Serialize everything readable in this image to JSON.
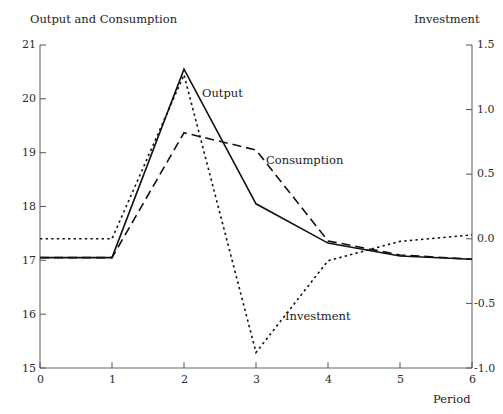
{
  "labels": {
    "left_axis_title": "Output and Consumption",
    "right_axis_title": "Investment",
    "xlabel": "Period",
    "series_output": "Output",
    "series_consumption": "Consumption",
    "series_investment": "Investment"
  },
  "axes": {
    "x_ticks": [
      "0",
      "1",
      "2",
      "3",
      "4",
      "5",
      "6"
    ],
    "left_ticks": [
      "21",
      "20",
      "19",
      "18",
      "17",
      "16",
      "15"
    ],
    "right_ticks": [
      "1.5",
      "1.0",
      "0.5",
      "0.0",
      "-0.5",
      "-1.0"
    ]
  },
  "chart_data": {
    "type": "line",
    "title": "",
    "xlabel": "Period",
    "ylabel": "Output and Consumption",
    "y2label": "Investment",
    "xlim": [
      0,
      6
    ],
    "ylim": [
      15,
      21
    ],
    "y2lim": [
      -1.0,
      1.5
    ],
    "grid": false,
    "legend": "inline-annotations",
    "x": [
      0,
      1,
      2,
      3,
      4,
      5,
      6
    ],
    "series": [
      {
        "name": "Output",
        "axis": "left",
        "style": "solid",
        "values": [
          17.05,
          17.05,
          20.55,
          18.05,
          17.32,
          17.08,
          17.02
        ]
      },
      {
        "name": "Consumption",
        "axis": "left",
        "style": "dashed",
        "values": [
          17.05,
          17.05,
          19.37,
          19.05,
          17.36,
          17.1,
          17.02
        ]
      },
      {
        "name": "Investment",
        "axis": "right",
        "style": "dotted",
        "values": [
          0.0,
          0.0,
          1.27,
          -0.88,
          -0.17,
          -0.02,
          0.03
        ]
      }
    ]
  }
}
